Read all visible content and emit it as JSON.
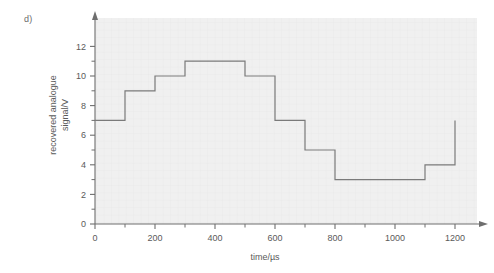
{
  "panel": {
    "label": "d)"
  },
  "colors": {
    "plot_background": "#f0f0f0",
    "grid": "#e4e4e4",
    "axis": "#6e6e6e",
    "trace": "#7a7a7a",
    "text": "#5a5a5a",
    "page_background": "#ffffff"
  },
  "chart_data": {
    "type": "line",
    "title": "",
    "xlabel": "time/µs",
    "ylabel": "recovered analogue signal/V",
    "ylabel_line1": "recovered analogue",
    "ylabel_line2": "signal/V",
    "xlim": [
      0,
      1300
    ],
    "ylim": [
      0,
      13
    ],
    "grid": true,
    "legend": null,
    "xticks": [
      0,
      200,
      400,
      600,
      800,
      1000,
      1200
    ],
    "xtick_labels": [
      "0",
      "200",
      "400",
      "600",
      "800",
      "1000",
      "1200"
    ],
    "xminor_ticks": [
      100,
      300,
      500,
      700,
      900,
      1100
    ],
    "yticks": [
      0,
      2,
      4,
      6,
      8,
      10,
      12
    ],
    "ytick_labels": [
      "0",
      "2",
      "4",
      "6",
      "8",
      "10",
      "12"
    ],
    "yminor_ticks": [
      1,
      3,
      5,
      7,
      9,
      11
    ],
    "interpolation": "step-post",
    "x": [
      0,
      100,
      200,
      300,
      500,
      600,
      700,
      800,
      1100,
      1200,
      1200
    ],
    "y": [
      7,
      9,
      10,
      11,
      10,
      7,
      5,
      3,
      4,
      4,
      7
    ],
    "steps": [
      {
        "x_start": 0,
        "x_end": 100,
        "value": 7
      },
      {
        "x_start": 100,
        "x_end": 200,
        "value": 9
      },
      {
        "x_start": 200,
        "x_end": 300,
        "value": 10
      },
      {
        "x_start": 300,
        "x_end": 500,
        "value": 11
      },
      {
        "x_start": 500,
        "x_end": 600,
        "value": 10
      },
      {
        "x_start": 600,
        "x_end": 700,
        "value": 7
      },
      {
        "x_start": 700,
        "x_end": 800,
        "value": 5
      },
      {
        "x_start": 800,
        "x_end": 1100,
        "value": 3
      },
      {
        "x_start": 1100,
        "x_end": 1200,
        "value": 4
      }
    ],
    "terminal_riser": {
      "x": 1200,
      "from": 4,
      "to": 7
    }
  }
}
